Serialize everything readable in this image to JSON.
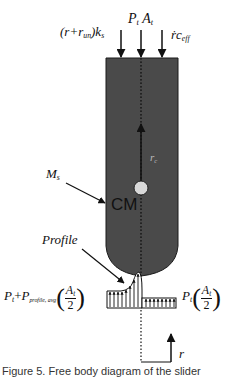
{
  "diagram": {
    "type": "free-body diagram of a slider body with pressure profile",
    "labels": {
      "spring_force": "(r+r_un)k_s",
      "spring_force_parts": {
        "open": "(r+r",
        "sub": "un",
        "close": ")k",
        "sub2": "s"
      },
      "top_pressure": "P_t A_t",
      "top_pressure_parts": {
        "p": "P",
        "p_sub": "t",
        "a": "A",
        "a_sub": "t"
      },
      "damping_force": "ṙc_eff",
      "damping_parts": {
        "main": "ṙc",
        "sub": "eff"
      },
      "radius_cm": "r_c",
      "radius_parts": {
        "main": "r",
        "sub": "c"
      },
      "center_of_mass": "CM",
      "mass": "M_s",
      "mass_parts": {
        "main": "M",
        "sub": "s"
      },
      "profile": "Profile",
      "left_pressure": "P_t + P_profile,avg (A_t / 2)",
      "left_pressure_parts": {
        "p1": "P",
        "p1_sub": "t",
        "plus": "+",
        "p2": "P",
        "p2_sub": "profile, avg",
        "num": "A",
        "num_sub": "t",
        "den": "2"
      },
      "right_pressure": "P_t (A_t / 2)",
      "right_pressure_parts": {
        "p": "P",
        "p_sub": "t",
        "num": "A",
        "num_sub": "t",
        "den": "2"
      },
      "coordinate": "r"
    },
    "colors": {
      "body_fill": "#4a4a4a",
      "body_stroke": "#1a1a1a",
      "cm_circle": "#d8d8d8",
      "line": "#111111",
      "background": "#ffffff"
    },
    "caption_fragment": "Figure 5. Free body diagram of the slider"
  }
}
